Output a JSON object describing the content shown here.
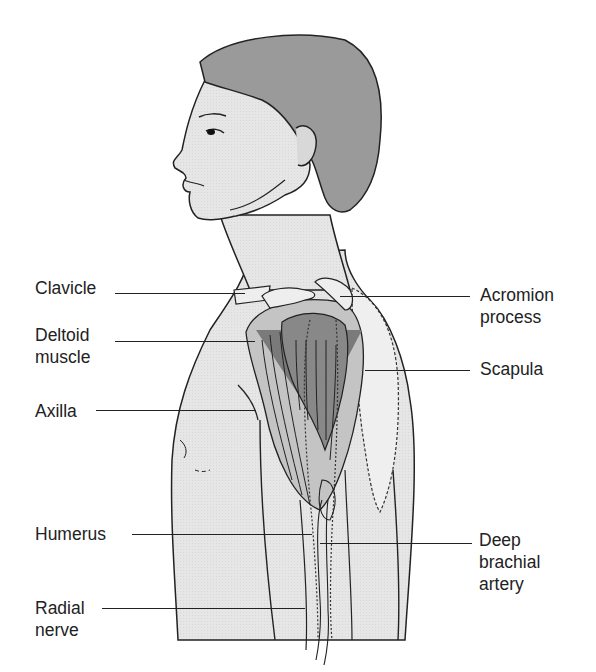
{
  "diagram": {
    "type": "anatomical-illustration",
    "colors": {
      "background": "#ffffff",
      "skin": "#e6e6e6",
      "hair": "#9a9a9a",
      "muscle_dark": "#7a7a7a",
      "muscle_light": "#c4c4c4",
      "bone": "#eeeeee",
      "outline": "#222222"
    },
    "labels_left": [
      {
        "id": "clavicle",
        "text": "Clavicle"
      },
      {
        "id": "deltoid",
        "text": "Deltoid\nmuscle"
      },
      {
        "id": "axilla",
        "text": "Axilla"
      },
      {
        "id": "humerus",
        "text": "Humerus"
      },
      {
        "id": "radial-nerve",
        "text": "Radial\nnerve"
      }
    ],
    "labels_right": [
      {
        "id": "acromion",
        "text": "Acromion\nprocess"
      },
      {
        "id": "scapula",
        "text": "Scapula"
      },
      {
        "id": "deep-brachial",
        "text": "Deep\nbrachial\nartery"
      }
    ]
  }
}
